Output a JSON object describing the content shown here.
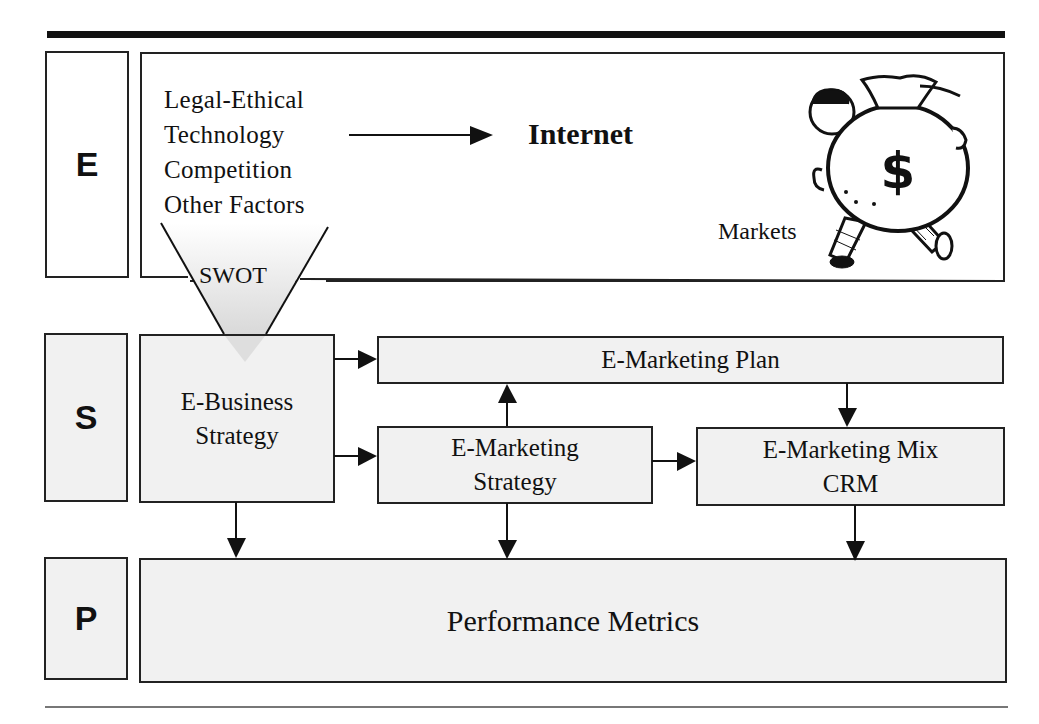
{
  "diagram": {
    "rows": [
      {
        "letter": "E"
      },
      {
        "letter": "S"
      },
      {
        "letter": "P"
      }
    ],
    "environment": {
      "factors": [
        "Legal-Ethical",
        "Technology",
        "Competition",
        "Other Factors"
      ],
      "internet_label": "Internet",
      "markets_label": "Markets",
      "illustration": "money-bag-man-icon",
      "swot_label": "SWOT"
    },
    "strategy": {
      "ebusiness": {
        "line1": "E-Business",
        "line2": "Strategy"
      },
      "plan": "E-Marketing Plan",
      "emarketing_strategy": {
        "line1": "E-Marketing",
        "line2": "Strategy"
      },
      "mix": {
        "line1": "E-Marketing Mix",
        "line2": "CRM"
      }
    },
    "performance": {
      "label": "Performance Metrics"
    },
    "colors": {
      "box_fill": "#f1f1f1",
      "line": "#222222"
    }
  }
}
